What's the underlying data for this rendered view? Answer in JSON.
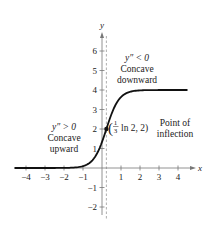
{
  "chart_data": {
    "type": "line",
    "title": "",
    "xlabel": "x",
    "ylabel": "y",
    "xlim": [
      -4.5,
      4.8
    ],
    "ylim": [
      -2.5,
      6.8
    ],
    "grid": false,
    "x_ticks": [
      -4,
      -3,
      -2,
      -1,
      1,
      2,
      3,
      4
    ],
    "x_tick_labels": [
      "−4",
      "−3",
      "−2",
      "−1",
      "1",
      "2",
      "3",
      "4"
    ],
    "y_ticks": [
      6,
      5,
      4,
      3,
      2,
      1,
      -1,
      -2
    ],
    "y_tick_labels": [
      "6",
      "5",
      "4",
      "3",
      "2",
      "1",
      "−1",
      "−2"
    ],
    "series": [
      {
        "name": "y = 4 / (1 + 2e^(−3x))",
        "function": "logistic",
        "L": 4,
        "A": 2,
        "k": 3,
        "x_range": [
          -4.6,
          4.5
        ],
        "color": "#111111"
      }
    ],
    "inflection_point": {
      "x": 0.231,
      "y": 2,
      "label": "(⅓ ln 2, 2)",
      "frac_num": "1",
      "frac_den": "3",
      "label_rest": "ln 2, 2)"
    },
    "dashed_line_x": 0.231,
    "annotations": [
      {
        "id": "concave-down",
        "lines": [
          "y″ < 0",
          "Concave",
          "downward"
        ]
      },
      {
        "id": "concave-up",
        "lines": [
          "y″ > 0",
          "Concave",
          "upward"
        ]
      },
      {
        "id": "inflection",
        "lines": [
          "Point of",
          "inflection"
        ]
      }
    ]
  }
}
